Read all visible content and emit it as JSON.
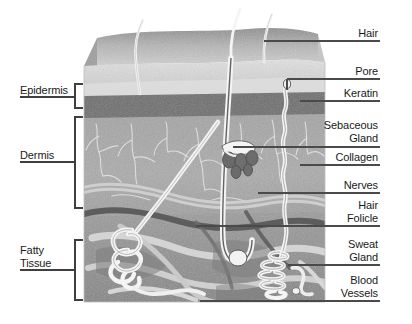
{
  "figure": {
    "background": "#ffffff",
    "line_color": "#4a4a4a",
    "text_color": "#1a1a1a"
  },
  "diagram_block": {
    "x": 84,
    "y": 26,
    "width": 241,
    "height": 276
  },
  "layers": [
    {
      "name": "surface",
      "label": "Skin surface",
      "fill": "#b9b9b9"
    },
    {
      "name": "epidermis",
      "label": "Epidermis",
      "fill": "#cfcfcf"
    },
    {
      "name": "basal",
      "label": "Basal layer",
      "fill": "#6f6f6f"
    },
    {
      "name": "dermis",
      "label": "Dermis",
      "fill": "#a8a8a8"
    },
    {
      "name": "fatty",
      "label": "Fatty Tissue",
      "fill": "#9a9a9a"
    }
  ],
  "left_labels": [
    {
      "id": "epidermis",
      "text": "Epidermis",
      "x": 16,
      "y": 89,
      "bracket": {
        "x": 74,
        "y": 86,
        "h": 22,
        "w": 9
      },
      "leader_y": 96,
      "leader_x1": 62,
      "leader_x2": 76
    },
    {
      "id": "dermis",
      "text": "Dermis",
      "x": 22,
      "y": 152,
      "bracket": {
        "x": 74,
        "y": 116,
        "h": 88,
        "w": 9
      },
      "leader_y": 160,
      "leader_x1": 58,
      "leader_x2": 76
    },
    {
      "id": "fatty-tissue",
      "text": "Fatty\nTissue",
      "x": 16,
      "y": 242,
      "bracket": {
        "x": 74,
        "y": 236,
        "h": 62,
        "w": 9
      },
      "leader_y": 258,
      "leader_x1": 58,
      "leader_x2": 76
    }
  ],
  "right_labels": [
    {
      "id": "hair",
      "text": "Hair",
      "y": 28,
      "leader_y": 41,
      "leader_x1": 264,
      "leader_x2": 378,
      "anchor_x": 264,
      "anchor_y": 41
    },
    {
      "id": "pore",
      "text": "Pore",
      "y": 68,
      "leader_y": 81,
      "leader_x1": 284,
      "leader_x2": 378,
      "anchor_x": 284,
      "anchor_y": 81,
      "tick": {
        "x": 284,
        "y1": 81,
        "y2": 92
      }
    },
    {
      "id": "keratin",
      "text": "Keratin",
      "y": 90,
      "leader_y": 103,
      "leader_x1": 300,
      "leader_x2": 378,
      "anchor_x": 300,
      "anchor_y": 103
    },
    {
      "id": "sebaceous-gland",
      "text": "Sebaceous\nGland",
      "y": 118,
      "leader_y": 146,
      "leader_x1": 232,
      "leader_x2": 378,
      "anchor_x": 232,
      "anchor_y": 146
    },
    {
      "id": "collagen",
      "text": "Collagen",
      "y": 152,
      "leader_y": 165,
      "leader_x1": 300,
      "leader_x2": 378,
      "anchor_x": 300,
      "anchor_y": 165
    },
    {
      "id": "nerves",
      "text": "Nerves",
      "y": 180,
      "leader_y": 193,
      "leader_x1": 258,
      "leader_x2": 378,
      "anchor_x": 258,
      "anchor_y": 193
    },
    {
      "id": "hair-folicle",
      "text": "Hair\nFolicle",
      "y": 200,
      "leader_y": 226,
      "leader_x1": 196,
      "leader_x2": 378,
      "anchor_x": 196,
      "anchor_y": 226
    },
    {
      "id": "sweat-gland",
      "text": "Sweat\nGland",
      "y": 239,
      "leader_y": 265,
      "leader_x1": 288,
      "leader_x2": 378,
      "anchor_x": 288,
      "anchor_y": 265
    },
    {
      "id": "blood-vessels",
      "text": "Blood\nVessels",
      "y": 275,
      "leader_y": 301,
      "leader_x1": 200,
      "leader_x2": 378,
      "anchor_x": 200,
      "anchor_y": 301
    }
  ],
  "structures": {
    "hairs_above_skin": 3,
    "hair_shaft_color": "#f2f2f2",
    "sweat_gland_coils": 5,
    "sebaceous_lobes": 5,
    "nerve_color": "#e8e8e8",
    "vessel_color": "#6a6a6a"
  }
}
